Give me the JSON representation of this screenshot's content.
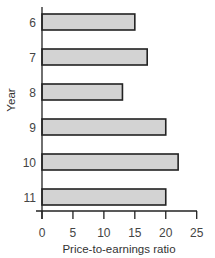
{
  "chart_data": {
    "type": "bar",
    "orientation": "horizontal",
    "title": "",
    "xlabel": "Price-to-earnings ratio",
    "ylabel": "Year",
    "categories": [
      "6",
      "7",
      "8",
      "9",
      "10",
      "11"
    ],
    "values": [
      15,
      17,
      13,
      20,
      22,
      20
    ],
    "xlim": [
      0,
      25
    ],
    "xticks": [
      0,
      5,
      10,
      15,
      20,
      25
    ],
    "xtick_labels": [
      "0",
      "5",
      "10",
      "15",
      "20",
      "25"
    ],
    "grid": false,
    "legend": null,
    "colors": {
      "bar_fill": "#d3d3d3",
      "bar_stroke": "#222222",
      "axis": "#222222"
    }
  }
}
